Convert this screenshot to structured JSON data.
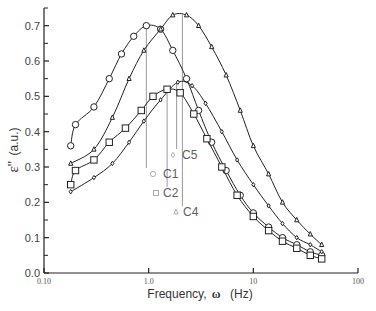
{
  "chart_data": {
    "type": "line",
    "title": "",
    "xlabel": "Frequency, ω (Hz)",
    "ylabel": "ε'' (a.u.)",
    "xscale": "log",
    "xlim": [
      0.1,
      100
    ],
    "ylim": [
      0.0,
      0.75
    ],
    "x_ticks": [
      "0.10",
      "1.0",
      "10",
      "100"
    ],
    "y_ticks": [
      "0.0",
      "0.1",
      "0.2",
      "0.3",
      "0.4",
      "0.5",
      "0.6",
      "0.7"
    ],
    "grid": false,
    "legend_position": "inline annotations near peaks",
    "series": [
      {
        "name": "C1",
        "marker": "circle",
        "peak_frequency": 0.95,
        "x": [
          0.18,
          0.2,
          0.3,
          0.42,
          0.55,
          0.72,
          0.95,
          1.3,
          1.7,
          2.3,
          3.0,
          4.0,
          5.5,
          7.5,
          10,
          14,
          19,
          26,
          35,
          45
        ],
        "y": [
          0.36,
          0.42,
          0.47,
          0.55,
          0.62,
          0.67,
          0.7,
          0.69,
          0.63,
          0.55,
          0.46,
          0.37,
          0.29,
          0.22,
          0.17,
          0.13,
          0.1,
          0.08,
          0.06,
          0.05
        ]
      },
      {
        "name": "C4",
        "marker": "triangle",
        "peak_frequency": 2.0,
        "x": [
          0.18,
          0.3,
          0.45,
          0.65,
          0.9,
          1.3,
          1.7,
          2.3,
          3.0,
          4.0,
          5.5,
          7.5,
          10,
          14,
          19,
          26,
          35,
          45
        ],
        "y": [
          0.31,
          0.35,
          0.44,
          0.55,
          0.63,
          0.69,
          0.73,
          0.73,
          0.7,
          0.64,
          0.56,
          0.46,
          0.36,
          0.28,
          0.2,
          0.15,
          0.11,
          0.08
        ]
      },
      {
        "name": "C5",
        "marker": "diamond",
        "peak_frequency": 1.9,
        "x": [
          0.18,
          0.3,
          0.45,
          0.65,
          0.9,
          1.3,
          1.9,
          2.6,
          3.5,
          5.0,
          7.0,
          10,
          14,
          19,
          26,
          35,
          45
        ],
        "y": [
          0.23,
          0.27,
          0.31,
          0.37,
          0.43,
          0.49,
          0.54,
          0.53,
          0.48,
          0.4,
          0.32,
          0.25,
          0.19,
          0.14,
          0.1,
          0.08,
          0.06
        ]
      },
      {
        "name": "C2",
        "marker": "square",
        "peak_frequency": 1.5,
        "x": [
          0.18,
          0.2,
          0.3,
          0.42,
          0.6,
          0.85,
          1.1,
          1.5,
          2.0,
          2.7,
          3.6,
          5.0,
          7.0,
          10,
          14,
          19,
          26,
          35,
          45
        ],
        "y": [
          0.25,
          0.29,
          0.32,
          0.37,
          0.41,
          0.46,
          0.5,
          0.52,
          0.51,
          0.45,
          0.38,
          0.3,
          0.22,
          0.16,
          0.12,
          0.09,
          0.07,
          0.05,
          0.04
        ]
      }
    ],
    "annotations": [
      {
        "label": "C1",
        "marker": "circle",
        "x_freq": 0.95
      },
      {
        "label": "C2",
        "marker": "square",
        "x_freq": 1.5
      },
      {
        "label": "C5",
        "marker": "diamond",
        "x_freq": 1.85
      },
      {
        "label": "C4",
        "marker": "triangle",
        "x_freq": 2.1
      }
    ]
  },
  "axes": {
    "xlabel_text": "Frequency,",
    "xlabel_symbol": "ω",
    "xlabel_unit": "(Hz)",
    "ylabel_symbol": "ε''",
    "ylabel_unit": "(a.u.)"
  },
  "legend": {
    "c1": "C1",
    "c2": "C2",
    "c4": "C4",
    "c5": "C5"
  }
}
